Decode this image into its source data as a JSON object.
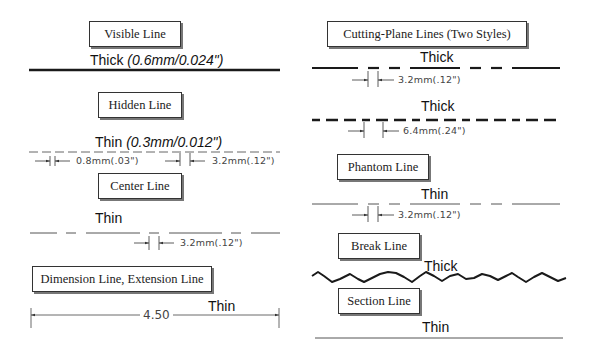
{
  "left_column": {
    "visible_line": {
      "title": "Visible Line",
      "weight": "Thick",
      "spec": "(0.6mm/0.024\")"
    },
    "hidden_line": {
      "title": "Hidden Line",
      "weight": "Thin",
      "spec": "(0.3mm/0.012\")",
      "dims": [
        "0.8mm(.03\")",
        "3.2mm(.12\")"
      ]
    },
    "center_line": {
      "title": "Center Line",
      "weight": "Thin",
      "dims": [
        "3.2mm(.12\")"
      ]
    },
    "dimension_line": {
      "title": "Dimension Line, Extension Line",
      "weight": "Thin",
      "value": "4.50"
    }
  },
  "right_column": {
    "cutting_plane": {
      "title": "Cutting-Plane Lines (Two Styles)",
      "style1": {
        "weight": "Thick",
        "dim": "3.2mm(.12\")"
      },
      "style2": {
        "weight": "Thick",
        "dim": "6.4mm(.24\")"
      }
    },
    "phantom_line": {
      "title": "Phantom Line",
      "weight": "Thin",
      "dim": "3.2mm(.12\")"
    },
    "break_line": {
      "title": "Break Line",
      "weight": "Thick"
    },
    "section_line": {
      "title": "Section Line",
      "weight": "Thin"
    }
  },
  "colors": {
    "line": "#1a1a1a",
    "thin_line": "#555555",
    "box_border": "#333333",
    "box_shadow": "#777777"
  }
}
